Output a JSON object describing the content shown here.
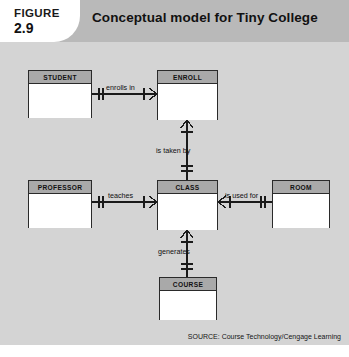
{
  "header": {
    "figure_word": "FIGURE",
    "figure_number": "2.9",
    "title": "Conceptual model for Tiny College",
    "band_color": "#b9b9b9",
    "white_color": "#ffffff"
  },
  "diagram": {
    "background_color": "#d4d4d4",
    "line_color": "#1a1a1a",
    "entity_header_color": "#a9a9a9",
    "entity_body_color": "#ffffff",
    "entities": [
      {
        "name": "STUDENT"
      },
      {
        "name": "ENROLL"
      },
      {
        "name": "PROFESSOR"
      },
      {
        "name": "CLASS"
      },
      {
        "name": "ROOM"
      },
      {
        "name": "COURSE"
      }
    ],
    "relationships": [
      {
        "verb": "enrolls in",
        "from": "STUDENT",
        "to": "ENROLL",
        "from_cardinality": "one-mandatory",
        "to_cardinality": "many-optional"
      },
      {
        "verb": "is taken by",
        "from": "ENROLL",
        "to": "CLASS",
        "from_cardinality": "many-optional",
        "to_cardinality": "one-mandatory"
      },
      {
        "verb": "teaches",
        "from": "PROFESSOR",
        "to": "CLASS",
        "from_cardinality": "one-mandatory",
        "to_cardinality": "many-optional"
      },
      {
        "verb": "is used for",
        "from": "CLASS",
        "to": "ROOM",
        "from_cardinality": "many-optional",
        "to_cardinality": "one-mandatory"
      },
      {
        "verb": "generates",
        "from": "CLASS",
        "to": "COURSE",
        "from_cardinality": "many-optional",
        "to_cardinality": "one-mandatory"
      }
    ]
  },
  "source": {
    "text": "SOURCE: Course Technology/Cengage Learning"
  }
}
